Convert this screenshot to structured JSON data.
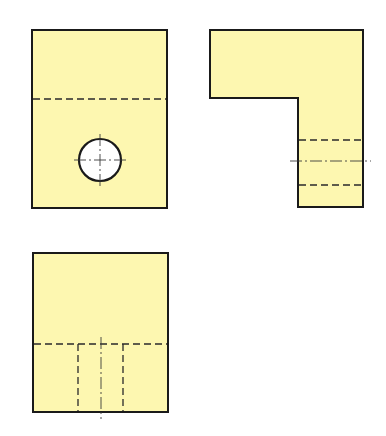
{
  "drawing": {
    "type": "orthographic-projection",
    "colors": {
      "fill": "#fdf7b0",
      "outline": "#1a1a1a",
      "hole_fill": "#ffffff",
      "background": "#ffffff"
    },
    "views": [
      {
        "name": "front-view",
        "label": ""
      },
      {
        "name": "side-view",
        "label": ""
      },
      {
        "name": "top-view",
        "label": ""
      }
    ]
  }
}
